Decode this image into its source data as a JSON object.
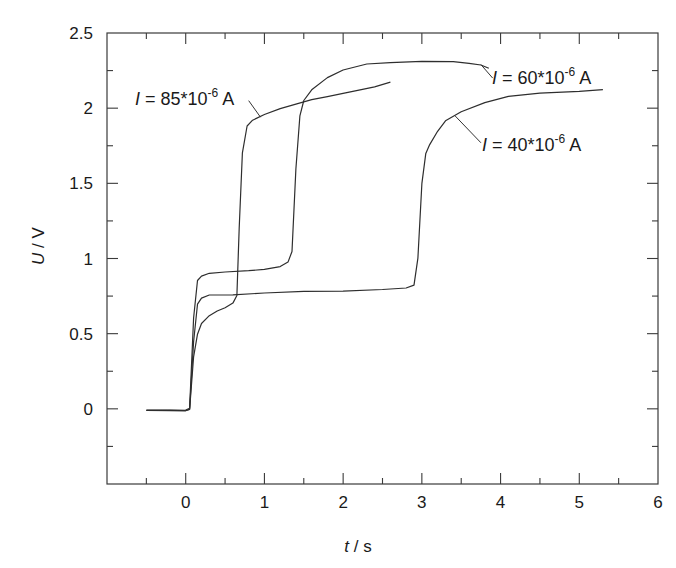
{
  "chart_data": {
    "type": "line",
    "title": "",
    "xlabel": "t / s",
    "ylabel": "U / V",
    "xlabel_italic": "t",
    "xlabel_unit": " / s",
    "ylabel_italic": "U",
    "ylabel_unit": " / V",
    "xlim": [
      -1,
      6
    ],
    "ylim": [
      -0.5,
      2.5
    ],
    "grid": false,
    "legend": "none (inline annotations)",
    "x_ticks": [
      0,
      1,
      2,
      3,
      4,
      5,
      6
    ],
    "x_tick_labels": [
      "0",
      "1",
      "2",
      "3",
      "4",
      "5",
      "6"
    ],
    "x_minor_ticks": [
      -0.5,
      0.5,
      1.5,
      2.5,
      3.5,
      4.5,
      5.5
    ],
    "y_ticks": [
      0,
      0.5,
      1,
      1.5,
      2,
      2.5
    ],
    "y_tick_labels": [
      "0",
      "0.5",
      "1",
      "1.5",
      "2",
      "2.5"
    ],
    "y_minor_ticks": [
      -0.25,
      0.25,
      0.75,
      1.25,
      1.75,
      2.25
    ],
    "series": [
      {
        "name": "I = 85*10^-6 A",
        "label_parts": {
          "var": "I",
          "eq": " = 85*10",
          "exp": "-6",
          "unit": " A"
        },
        "x": [
          -0.5,
          -0.2,
          0.0,
          0.05,
          0.1,
          0.15,
          0.2,
          0.3,
          0.4,
          0.5,
          0.6,
          0.65,
          0.68,
          0.72,
          0.78,
          0.85,
          1.0,
          1.2,
          1.4,
          1.6,
          1.8,
          2.0,
          2.2,
          2.4,
          2.6
        ],
        "values": [
          -0.01,
          -0.01,
          -0.01,
          0.0,
          0.35,
          0.5,
          0.57,
          0.62,
          0.65,
          0.67,
          0.7,
          0.75,
          1.2,
          1.7,
          1.88,
          1.92,
          1.96,
          2.0,
          2.03,
          2.06,
          2.08,
          2.1,
          2.12,
          2.14,
          2.17
        ]
      },
      {
        "name": "I = 60*10^-6 A",
        "label_parts": {
          "var": "I",
          "eq": " = 60*10",
          "exp": "-6",
          "unit": " A"
        },
        "x": [
          -0.5,
          -0.2,
          0.0,
          0.05,
          0.1,
          0.15,
          0.2,
          0.3,
          0.5,
          0.8,
          1.0,
          1.2,
          1.3,
          1.35,
          1.4,
          1.45,
          1.5,
          1.6,
          1.8,
          2.0,
          2.3,
          2.6,
          3.0,
          3.4,
          3.6,
          3.75,
          3.85
        ],
        "values": [
          -0.01,
          -0.01,
          -0.01,
          0.0,
          0.6,
          0.85,
          0.88,
          0.9,
          0.91,
          0.92,
          0.93,
          0.95,
          0.98,
          1.05,
          1.6,
          1.95,
          2.05,
          2.12,
          2.2,
          2.25,
          2.29,
          2.3,
          2.31,
          2.31,
          2.3,
          2.29,
          2.27
        ]
      },
      {
        "name": "I = 40*10^-6 A",
        "label_parts": {
          "var": "I",
          "eq": " = 40*10",
          "exp": "-6",
          "unit": " A"
        },
        "x": [
          -0.5,
          -0.2,
          0.0,
          0.05,
          0.1,
          0.15,
          0.2,
          0.3,
          0.6,
          1.0,
          1.5,
          2.0,
          2.5,
          2.8,
          2.9,
          2.95,
          3.0,
          3.05,
          3.1,
          3.2,
          3.3,
          3.5,
          3.8,
          4.1,
          4.5,
          5.0,
          5.3
        ],
        "values": [
          -0.01,
          -0.01,
          -0.01,
          0.0,
          0.45,
          0.7,
          0.74,
          0.76,
          0.76,
          0.77,
          0.78,
          0.78,
          0.79,
          0.8,
          0.82,
          1.0,
          1.5,
          1.7,
          1.76,
          1.85,
          1.92,
          1.98,
          2.04,
          2.08,
          2.1,
          2.11,
          2.12
        ]
      }
    ],
    "annotations": [
      {
        "series": 0,
        "text": "I = 85*10^-6 A",
        "leader_from": [
          0.95,
          1.94
        ],
        "leader_to": [
          0.8,
          2.05
        ]
      },
      {
        "series": 1,
        "text": "I = 60*10^-6 A",
        "leader_from": [
          3.75,
          2.29
        ],
        "leader_to": [
          3.9,
          2.2
        ]
      },
      {
        "series": 2,
        "text": "I = 40*10^-6 A",
        "leader_from": [
          3.42,
          1.95
        ],
        "leader_to": [
          3.75,
          1.77
        ]
      }
    ]
  }
}
